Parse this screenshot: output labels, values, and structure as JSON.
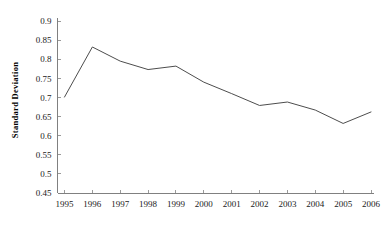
{
  "chart_data": {
    "type": "line",
    "title": "",
    "subtitle": "",
    "xlabel": "",
    "ylabel": "Standard Deviation",
    "categories": [
      "1995",
      "1996",
      "1997",
      "1998",
      "1999",
      "2000",
      "2001",
      "2002",
      "2003",
      "2004",
      "2005",
      "2006"
    ],
    "x": [
      1995,
      1996,
      1997,
      1998,
      1999,
      2000,
      2001,
      2002,
      2003,
      2004,
      2005,
      2006
    ],
    "series": [
      {
        "name": "Standard Deviation",
        "values": [
          0.701,
          0.832,
          0.795,
          0.773,
          0.782,
          0.74,
          0.71,
          0.679,
          0.688,
          0.667,
          0.632,
          0.662
        ],
        "color": "#4d4d4d"
      }
    ],
    "values": [
      0.701,
      0.832,
      0.795,
      0.773,
      0.782,
      0.74,
      0.71,
      0.679,
      0.688,
      0.667,
      0.632,
      0.662
    ],
    "ylim": [
      0.45,
      0.9
    ],
    "y_ticks": [
      "0.45",
      "0.5",
      "0.55",
      "0.6",
      "0.65",
      "0.7",
      "0.75",
      "0.8",
      "0.85",
      "0.9"
    ],
    "y_tick_values": [
      0.45,
      0.5,
      0.55,
      0.6,
      0.65,
      0.7,
      0.75,
      0.8,
      0.85,
      0.9
    ],
    "y_tick_step": 0.05,
    "x_tick_labels": [
      "1995",
      "1996",
      "1997",
      "1998",
      "1999",
      "2000",
      "2001",
      "2002",
      "2003",
      "2004",
      "2005",
      "2006"
    ],
    "grid": false,
    "legend": false,
    "legend_position": "none",
    "axis_color": "#808080",
    "text_color": "#1a1a1a",
    "background": "#ffffff"
  }
}
